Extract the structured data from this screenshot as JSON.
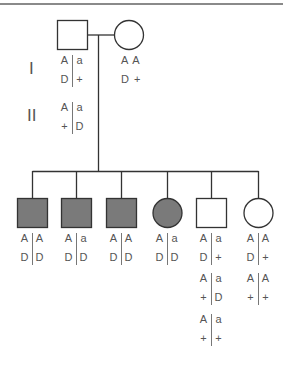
{
  "diagram": {
    "type": "pedigree",
    "colors": {
      "line": "#333333",
      "affected_fill": "#7a7a7a",
      "unaffected_fill": "#ffffff",
      "text": "#555555",
      "top_rule": "#8a8a8a"
    },
    "generations": [
      {
        "label": "I"
      },
      {
        "label": "II"
      }
    ],
    "gen1": {
      "father": {
        "sex": "male",
        "affected": false,
        "genotype": {
          "top_left": "A",
          "top_right": "a",
          "bottom_left": "D",
          "bottom_right": "+"
        }
      },
      "mother": {
        "sex": "female",
        "affected": false,
        "genotype": {
          "line1": "A A",
          "line2": "D +"
        }
      },
      "gamete_example": {
        "top_left": "A",
        "top_right": "a",
        "bottom_left": "+",
        "bottom_right": "D"
      }
    },
    "children": [
      {
        "sex": "male",
        "affected": true,
        "genotypes": [
          {
            "tl": "A",
            "tr": "A",
            "bl": "D",
            "br": "D"
          }
        ]
      },
      {
        "sex": "male",
        "affected": true,
        "genotypes": [
          {
            "tl": "A",
            "tr": "a",
            "bl": "D",
            "br": "D"
          }
        ]
      },
      {
        "sex": "male",
        "affected": true,
        "genotypes": [
          {
            "tl": "A",
            "tr": "A",
            "bl": "D",
            "br": "D"
          }
        ]
      },
      {
        "sex": "female",
        "affected": true,
        "genotypes": [
          {
            "tl": "A",
            "tr": "a",
            "bl": "D",
            "br": "D"
          }
        ]
      },
      {
        "sex": "male",
        "affected": false,
        "genotypes": [
          {
            "tl": "A",
            "tr": "a",
            "bl": "D",
            "br": "+"
          },
          {
            "tl": "A",
            "tr": "a",
            "bl": "+",
            "br": "D"
          },
          {
            "tl": "A",
            "tr": "a",
            "bl": "+",
            "br": "+"
          }
        ]
      },
      {
        "sex": "female",
        "affected": false,
        "genotypes": [
          {
            "tl": "A",
            "tr": "A",
            "bl": "D",
            "br": "+"
          },
          {
            "tl": "A",
            "tr": "A",
            "bl": "+",
            "br": "+"
          }
        ]
      }
    ]
  }
}
